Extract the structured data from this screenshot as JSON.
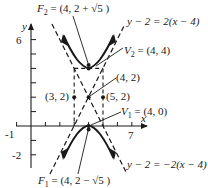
{
  "figure": {
    "type": "hyperbola-graph",
    "equation_form": "vertical hyperbola centered at (4, 2), a = 2, b = 1",
    "axes": {
      "x_label": "x",
      "y_label": "y",
      "x_tick_labels": [
        "-1",
        "7"
      ],
      "y_tick_labels": [
        "6",
        "-2"
      ],
      "x_range": [
        -1,
        8
      ],
      "y_range": [
        -3,
        7
      ]
    },
    "points": {
      "F2": {
        "label": "F",
        "sub": "2",
        "text": " = (4, 2 + √5 )"
      },
      "V2": {
        "label": "V",
        "sub": "2",
        "text": " = (4, 4)"
      },
      "center": {
        "text": "(4, 2)"
      },
      "left": {
        "text": "(3, 2)"
      },
      "right": {
        "text": "(5, 2)"
      },
      "V1": {
        "label": "V",
        "sub": "1",
        "text": " = (4, 0)"
      },
      "F1": {
        "label": "F",
        "sub": "1",
        "text": " = (4, 2 − √5 )"
      }
    },
    "asymptotes": {
      "upper_right": "y − 2 = 2(x − 4)",
      "lower_right": "y − 2 = −2(x − 4)"
    },
    "colors": {
      "ink": "#1a1a1a",
      "background": "#ffffff"
    }
  }
}
